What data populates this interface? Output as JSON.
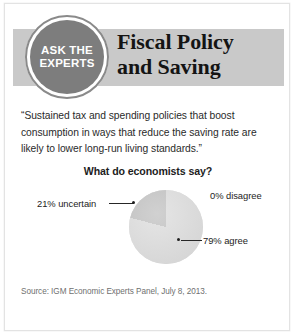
{
  "card": {
    "badge": {
      "line1": "ASK THE",
      "line2": "EXPERTS"
    },
    "title_line1": "Fiscal Policy",
    "title_line2": "and Saving",
    "quote": "“Sustained tax and spending policies that boost consumption in ways that reduce the saving rate are likely to lower long-run living standards.”",
    "question": "What do economists say?",
    "source": "Source: IGM Economic Experts Panel, July 8, 2013."
  },
  "colors": {
    "band": "#c9c9c9",
    "badge_fill": "#7d7d7d",
    "badge_ring": "#8a8a8a",
    "slice_agree": "#dedede",
    "slice_uncertain": "#c4c4c4",
    "text": "#232323",
    "source_text": "#6f6f6f"
  },
  "chart_data": {
    "type": "pie",
    "title": "What do economists say?",
    "categories": [
      "79% agree",
      "21% uncertain",
      "0% disagree"
    ],
    "values": [
      79,
      21,
      0
    ],
    "labels": {
      "agree": "79% agree",
      "uncertain": "21% uncertain",
      "disagree": "0% disagree"
    },
    "slice_colors": [
      "#dedede",
      "#c4c4c4",
      "#dedede"
    ],
    "start_angle_deg": 0,
    "direction": "counterclockwise",
    "legend": "none",
    "grid": false,
    "xlabel": "",
    "ylabel": "",
    "source": "Source: IGM Economic Experts Panel, July 8, 2013."
  }
}
